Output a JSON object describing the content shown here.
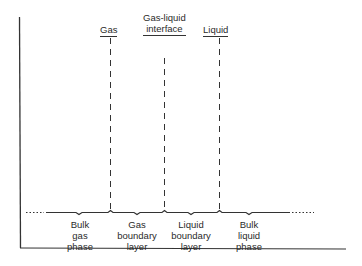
{
  "diagram": {
    "colors": {
      "line": "#333333",
      "background": "#ffffff",
      "text": "#2a2a2a"
    },
    "top_labels": [
      {
        "id": "gas",
        "lines": [
          "Gas"
        ],
        "x": 110
      },
      {
        "id": "interface",
        "lines": [
          "Gas-liquid",
          "interface"
        ],
        "x": 164
      },
      {
        "id": "liquid",
        "lines": [
          "Liquid"
        ],
        "x": 218
      }
    ],
    "regions": [
      {
        "id": "bulk-gas",
        "lines": [
          "Bulk",
          "gas",
          "phase"
        ]
      },
      {
        "id": "gas-boundary",
        "lines": [
          "Gas",
          "boundary",
          "layer"
        ]
      },
      {
        "id": "liquid-boundary",
        "lines": [
          "Liquid",
          "boundary",
          "layer"
        ]
      },
      {
        "id": "bulk-liquid",
        "lines": [
          "Bulk",
          "liquid",
          "phase"
        ]
      }
    ]
  }
}
